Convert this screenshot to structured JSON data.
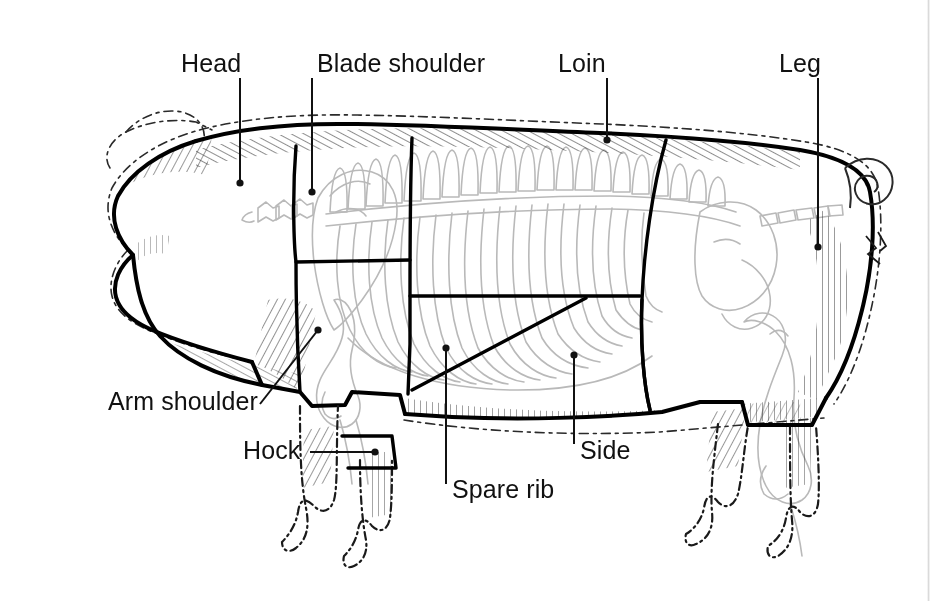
{
  "diagram": {
    "background_color": "#ffffff",
    "ink_color": "#111111",
    "bone_color": "#b9b9b9",
    "cut_line_color": "#000000",
    "style": "line-art engraving with hatching"
  },
  "labels": [
    {
      "id": "head",
      "text": "Head",
      "text_x": 181,
      "text_y": 72,
      "anchor": "start",
      "leader": {
        "type": "vertical",
        "x1": 240,
        "y1": 78,
        "x2": 240,
        "y2": 183
      },
      "dot": {
        "x": 240,
        "y": 183
      }
    },
    {
      "id": "blade-shoulder",
      "text": "Blade shoulder",
      "text_x": 317,
      "text_y": 72,
      "anchor": "start",
      "leader": {
        "type": "vertical",
        "x1": 312,
        "y1": 78,
        "x2": 312,
        "y2": 192
      },
      "dot": {
        "x": 312,
        "y": 192
      }
    },
    {
      "id": "loin",
      "text": "Loin",
      "text_x": 558,
      "text_y": 72,
      "anchor": "start",
      "leader": {
        "type": "vertical",
        "x1": 607,
        "y1": 78,
        "x2": 607,
        "y2": 140
      },
      "dot": {
        "x": 607,
        "y": 140
      }
    },
    {
      "id": "leg",
      "text": "Leg",
      "text_x": 779,
      "text_y": 72,
      "anchor": "start",
      "leader": {
        "type": "vertical",
        "x1": 818,
        "y1": 78,
        "x2": 818,
        "y2": 247
      },
      "dot": {
        "x": 818,
        "y": 247
      }
    },
    {
      "id": "arm-shoulder",
      "text": "Arm shoulder",
      "text_x": 108,
      "text_y": 410,
      "anchor": "start",
      "leader": {
        "type": "diagonal",
        "x1": 260,
        "y1": 404,
        "x2": 318,
        "y2": 330
      },
      "dot": {
        "x": 318,
        "y": 330
      }
    },
    {
      "id": "hock",
      "text": "Hock",
      "text_x": 243,
      "text_y": 459,
      "anchor": "start",
      "leader": {
        "type": "horizontal",
        "x1": 310,
        "y1": 452,
        "x2": 375,
        "y2": 452
      },
      "dot": {
        "x": 375,
        "y": 452
      }
    },
    {
      "id": "spare-rib",
      "text": "Spare rib",
      "text_x": 452,
      "text_y": 498,
      "anchor": "start",
      "leader": {
        "type": "vertical",
        "x1": 446,
        "y1": 484,
        "x2": 446,
        "y2": 348
      },
      "dot": {
        "x": 446,
        "y": 348
      }
    },
    {
      "id": "side",
      "text": "Side",
      "text_x": 580,
      "text_y": 459,
      "anchor": "start",
      "leader": {
        "type": "vertical",
        "x1": 574,
        "y1": 444,
        "x2": 574,
        "y2": 355
      },
      "dot": {
        "x": 574,
        "y": 355
      }
    }
  ],
  "primal_cuts": [
    {
      "name": "Head",
      "region": "front of animal forward of the shoulder cut line"
    },
    {
      "name": "Blade shoulder",
      "region": "upper shoulder above the arm shoulder"
    },
    {
      "name": "Loin",
      "region": "top back from shoulder to leg"
    },
    {
      "name": "Leg",
      "region": "hind quarter / ham"
    },
    {
      "name": "Arm shoulder",
      "region": "lower shoulder / picnic"
    },
    {
      "name": "Hock",
      "region": "lower front leg"
    },
    {
      "name": "Spare rib",
      "region": "lower rib section behind the shoulder"
    },
    {
      "name": "Side",
      "region": "belly / bacon side"
    }
  ]
}
